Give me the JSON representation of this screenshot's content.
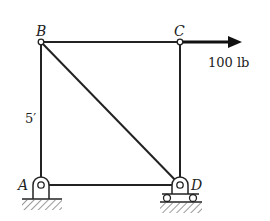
{
  "diagram": {
    "type": "truss",
    "joints": {
      "A": {
        "label": "A",
        "support": "pin"
      },
      "B": {
        "label": "B"
      },
      "C": {
        "label": "C"
      },
      "D": {
        "label": "D",
        "support": "roller"
      }
    },
    "members": [
      {
        "from": "A",
        "to": "B"
      },
      {
        "from": "B",
        "to": "C"
      },
      {
        "from": "C",
        "to": "D"
      },
      {
        "from": "A",
        "to": "D"
      },
      {
        "from": "B",
        "to": "D"
      }
    ],
    "load": {
      "joint": "C",
      "direction": "right",
      "label": "100 lb"
    },
    "dimension": {
      "member": "AB",
      "label": "5′"
    }
  }
}
